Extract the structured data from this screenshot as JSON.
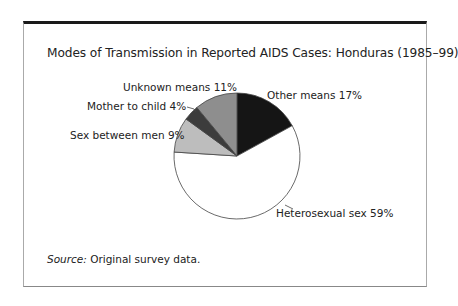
{
  "chart_data": {
    "type": "pie",
    "title": "Modes of Transmission in Reported AIDS Cases: Honduras (1985–99)",
    "categories": [
      "Other means",
      "Heterosexual sex",
      "Sex between men",
      "Mother to child",
      "Unknown means"
    ],
    "values": [
      17,
      59,
      9,
      4,
      11
    ],
    "unit": "%",
    "colors": [
      "#151515",
      "#ffffff",
      "#bdbdbd",
      "#3c3c3c",
      "#8e8e8e"
    ],
    "labels": [
      "Other means 17%",
      "Heterosexual sex 59%",
      "Sex between men 9%",
      "Mother to child 4%",
      "Unknown means 11%"
    ],
    "source_label": "Source:",
    "source_text": " Original survey data."
  }
}
